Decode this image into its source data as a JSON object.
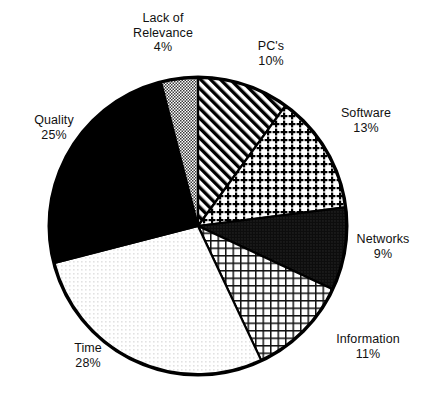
{
  "chart_data": {
    "type": "pie",
    "title": "",
    "subtitle": "",
    "xlabel": "",
    "ylabel": "",
    "legend_position": "none",
    "grid": false,
    "value_unit": "%",
    "start_angle_deg": 0,
    "direction": "clockwise",
    "categories": [
      "PC's",
      "Software",
      "Networks",
      "Information",
      "Time",
      "Quality",
      "Lack of Relevance"
    ],
    "values": [
      10,
      13,
      9,
      11,
      28,
      25,
      4
    ],
    "slices": [
      {
        "name": "PC's",
        "label": "PC's",
        "value": 10,
        "value_text": "10%",
        "pattern": "diagonal-stripes",
        "fill_hex": "#ffffff",
        "ink_hex": "#000000"
      },
      {
        "name": "Software",
        "label": "Software",
        "value": 13,
        "value_text": "13%",
        "pattern": "cross-dots",
        "fill_hex": "#ffffff",
        "ink_hex": "#000000"
      },
      {
        "name": "Networks",
        "label": "Networks",
        "value": 9,
        "value_text": "9%",
        "pattern": "dense-dark-dots",
        "fill_hex": "#111111",
        "ink_hex": "#000000"
      },
      {
        "name": "Information",
        "label": "Information",
        "value": 11,
        "value_text": "11%",
        "pattern": "fine-grid",
        "fill_hex": "#ffffff",
        "ink_hex": "#000000"
      },
      {
        "name": "Time",
        "label": "Time",
        "value": 28,
        "value_text": "28%",
        "pattern": "light-stipple",
        "fill_hex": "#ffffff",
        "ink_hex": "#bfbfbf"
      },
      {
        "name": "Quality",
        "label": "Quality",
        "value": 25,
        "value_text": "25%",
        "pattern": "solid-black",
        "fill_hex": "#000000",
        "ink_hex": "#000000"
      },
      {
        "name": "Lack of Relevance",
        "label": "Lack of\nRelevance",
        "label_line1": "Lack of",
        "label_line2": "Relevance",
        "value": 4,
        "value_text": "4%",
        "pattern": "medium-checker",
        "fill_hex": "#c9c9c9",
        "ink_hex": "#000000"
      }
    ]
  },
  "labels": {
    "lack_of_relevance": {
      "line1": "Lack of",
      "line2": "Relevance",
      "value": "4%"
    },
    "pcs": {
      "name": "PC's",
      "value": "10%"
    },
    "software": {
      "name": "Software",
      "value": "13%"
    },
    "networks": {
      "name": "Networks",
      "value": "9%"
    },
    "information": {
      "name": "Information",
      "value": "11%"
    },
    "time": {
      "name": "Time",
      "value": "28%"
    },
    "quality": {
      "name": "Quality",
      "value": "25%"
    }
  }
}
